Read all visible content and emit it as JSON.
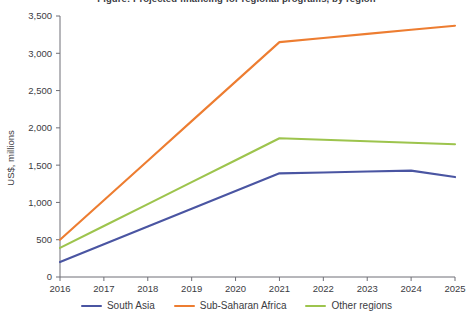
{
  "title_clipped": "Figure: Projected financing for regional programs, by region",
  "chart_data": {
    "type": "line",
    "title": "",
    "xlabel": "",
    "ylabel": "US$, millions",
    "x": [
      2016,
      2017,
      2018,
      2019,
      2020,
      2021,
      2022,
      2023,
      2024,
      2025
    ],
    "xtick_labels": [
      "2016",
      "2017",
      "2018",
      "2019",
      "2020",
      "2021",
      "2022",
      "2023",
      "2024",
      "2025"
    ],
    "xlim": [
      2016,
      2025
    ],
    "ylim": [
      0,
      3500
    ],
    "ytick_values": [
      0,
      500,
      1000,
      1500,
      2000,
      2500,
      3000,
      3500
    ],
    "ytick_labels": [
      "0",
      "500",
      "1,000",
      "1,500",
      "2,000",
      "2,500",
      "3,000",
      "3,500"
    ],
    "grid": false,
    "legend_position": "bottom",
    "series": [
      {
        "name": "South Asia",
        "color": "#4a55a2",
        "values": [
          200,
          438,
          676,
          914,
          1152,
          1390,
          1402,
          1414,
          1427,
          1340
        ]
      },
      {
        "name": "Sub-Saharan Africa",
        "color": "#ed7d31",
        "values": [
          500,
          1030,
          1560,
          2090,
          2620,
          3150,
          3205,
          3260,
          3315,
          3370
        ]
      },
      {
        "name": "Other regions",
        "color": "#9dc44d",
        "values": [
          390,
          684,
          978,
          1272,
          1566,
          1860,
          1840,
          1820,
          1800,
          1780
        ]
      }
    ]
  },
  "legend": {
    "items": [
      {
        "label": "South Asia",
        "color": "#4a55a2"
      },
      {
        "label": "Sub-Saharan Africa",
        "color": "#ed7d31"
      },
      {
        "label": "Other regions",
        "color": "#9dc44d"
      }
    ]
  }
}
